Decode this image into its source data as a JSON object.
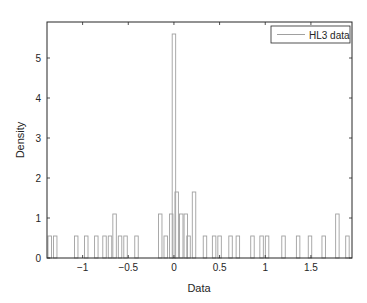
{
  "chart_data": {
    "type": "bar",
    "subtype": "histogram",
    "title": "",
    "xlabel": "Data",
    "ylabel": "Density",
    "xlim": [
      -1.39,
      1.95
    ],
    "ylim": [
      0,
      5.9
    ],
    "xticks": [
      -1,
      -0.5,
      0,
      0.5,
      1,
      1.5
    ],
    "xtick_labels": [
      "−1",
      "−0.5",
      "0",
      "0.5",
      "1",
      "1.5"
    ],
    "yticks": [
      0,
      1,
      2,
      3,
      4,
      5
    ],
    "ytick_labels": [
      "0",
      "1",
      "2",
      "3",
      "4",
      "5"
    ],
    "grid": false,
    "legend": {
      "position": "upper right",
      "entries": [
        "HL3 data"
      ]
    },
    "bin_width": 0.038,
    "series": [
      {
        "name": "HL3 data",
        "color": "#a0a0a0",
        "fill": "none",
        "bins": [
          {
            "x": -1.36,
            "density": 0.55
          },
          {
            "x": -1.3,
            "density": 0.55
          },
          {
            "x": -1.07,
            "density": 0.55
          },
          {
            "x": -0.96,
            "density": 0.55
          },
          {
            "x": -0.85,
            "density": 0.55
          },
          {
            "x": -0.76,
            "density": 0.55
          },
          {
            "x": -0.7,
            "density": 0.55
          },
          {
            "x": -0.65,
            "density": 1.1
          },
          {
            "x": -0.59,
            "density": 0.55
          },
          {
            "x": -0.53,
            "density": 0.55
          },
          {
            "x": -0.41,
            "density": 0.55
          },
          {
            "x": -0.15,
            "density": 1.1
          },
          {
            "x": -0.09,
            "density": 0.55
          },
          {
            "x": -0.03,
            "density": 1.1
          },
          {
            "x": 0.0,
            "density": 5.6
          },
          {
            "x": 0.03,
            "density": 1.65
          },
          {
            "x": 0.08,
            "density": 1.1
          },
          {
            "x": 0.13,
            "density": 1.1
          },
          {
            "x": 0.16,
            "density": 0.55
          },
          {
            "x": 0.22,
            "density": 1.65
          },
          {
            "x": 0.34,
            "density": 0.55
          },
          {
            "x": 0.44,
            "density": 0.55
          },
          {
            "x": 0.5,
            "density": 0.55
          },
          {
            "x": 0.62,
            "density": 0.55
          },
          {
            "x": 0.7,
            "density": 0.55
          },
          {
            "x": 0.86,
            "density": 0.55
          },
          {
            "x": 0.96,
            "density": 0.55
          },
          {
            "x": 1.02,
            "density": 0.55
          },
          {
            "x": 1.2,
            "density": 0.55
          },
          {
            "x": 1.36,
            "density": 0.55
          },
          {
            "x": 1.49,
            "density": 0.55
          },
          {
            "x": 1.64,
            "density": 0.55
          },
          {
            "x": 1.79,
            "density": 1.1
          },
          {
            "x": 1.9,
            "density": 0.55
          }
        ]
      }
    ]
  },
  "colors": {
    "axes": "#262626",
    "bar_edge": "#a0a0a0",
    "legend_line": "#a0a0a0",
    "background": "#ffffff"
  }
}
